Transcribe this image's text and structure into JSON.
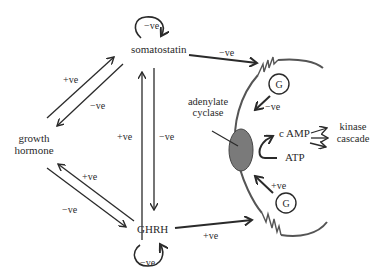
{
  "nodes": {
    "somatostatin": "somatostatin",
    "growth_hormone_line1": "growth",
    "growth_hormone_line2": "hormone",
    "ghrh": "GHRH",
    "adenylate_line1": "adenylate",
    "adenylate_line2": "cyclase",
    "camp": "c AMP",
    "atp": "ATP",
    "kinase_line1": "kinase",
    "kinase_line2": "cascade",
    "g_protein_top": "G",
    "g_protein_bottom": "G"
  },
  "edge_labels": {
    "somatostatin_self": "−ve",
    "ghrh_self": "−ve",
    "gh_to_somatostatin": "+ve",
    "somatostatin_to_gh": "−ve",
    "ghrh_to_somatostatin": "+ve",
    "somatostatin_to_ghrh": "−ve",
    "gh_to_ghrh": "−ve",
    "ghrh_to_gh": "+ve",
    "somatostatin_to_receptor": "−ve",
    "ghrh_to_receptor": "+ve",
    "g_top_to_cyclase": "−ve",
    "g_bottom_to_cyclase": "+ve"
  },
  "colors": {
    "line": "#2a2a2a",
    "membrane": "#555555",
    "cyclase_fill": "#7a7a7a",
    "background": "#ffffff"
  }
}
